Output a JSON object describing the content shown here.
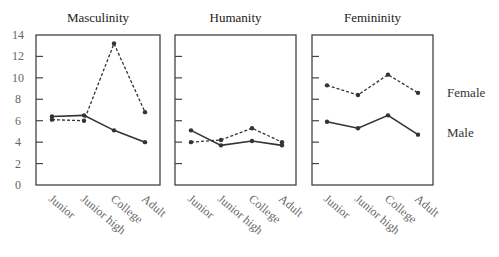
{
  "chart_data": {
    "type": "line",
    "categories": [
      "Junior",
      "Junior high",
      "College",
      "Adult"
    ],
    "ylim": [
      0,
      14
    ],
    "yticks": [
      0,
      2,
      4,
      6,
      8,
      10,
      12,
      14
    ],
    "grid": false,
    "legend_position": "right",
    "legend": [
      {
        "name": "Female",
        "style": "dashed"
      },
      {
        "name": "Male",
        "style": "solid"
      }
    ],
    "panels": [
      {
        "title": "Masculinity",
        "series": [
          {
            "name": "Female",
            "style": "dashed",
            "values": [
              6.1,
              6.0,
              13.2,
              6.8
            ]
          },
          {
            "name": "Male",
            "style": "solid",
            "values": [
              6.4,
              6.5,
              5.1,
              4.0
            ]
          }
        ]
      },
      {
        "title": "Humanity",
        "series": [
          {
            "name": "Female",
            "style": "dashed",
            "values": [
              4.0,
              4.2,
              5.3,
              4.0
            ]
          },
          {
            "name": "Male",
            "style": "solid",
            "values": [
              5.1,
              3.7,
              4.1,
              3.7
            ]
          }
        ]
      },
      {
        "title": "Femininity",
        "series": [
          {
            "name": "Female",
            "style": "dashed",
            "values": [
              9.3,
              8.4,
              10.3,
              8.6
            ]
          },
          {
            "name": "Male",
            "style": "solid",
            "values": [
              5.9,
              5.3,
              6.5,
              4.7
            ]
          }
        ]
      }
    ]
  },
  "colors": {
    "line": "#333333",
    "axis": "#444444",
    "text": "#333333",
    "tick_text": "#666666"
  }
}
